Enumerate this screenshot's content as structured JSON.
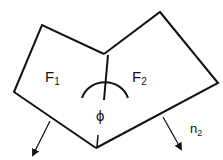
{
  "diagram": {
    "labels": {
      "face1": "F",
      "face1_sub": "1",
      "face2": "F",
      "face2_sub": "2",
      "angle": "ϕ",
      "normal2": "n",
      "normal2_sub": "2"
    },
    "colors": {
      "stroke": "#111111",
      "background": "#ffffff"
    }
  }
}
